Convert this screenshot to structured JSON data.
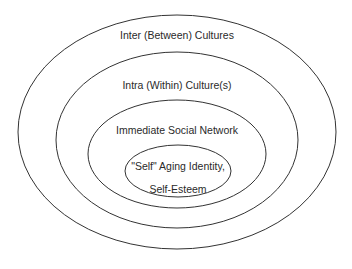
{
  "diagram": {
    "type": "nested-ellipses",
    "colors": {
      "stroke": "#333333",
      "text": "#2a2a2a",
      "background": "#ffffff"
    },
    "layers": [
      {
        "label": "Inter (Between) Cultures"
      },
      {
        "label": "Intra (Within) Culture(s)"
      },
      {
        "label": "Immediate Social Network"
      },
      {
        "label_line1": "\"Self\" Aging Identity,",
        "label_line2": "Self-Esteem"
      }
    ]
  }
}
